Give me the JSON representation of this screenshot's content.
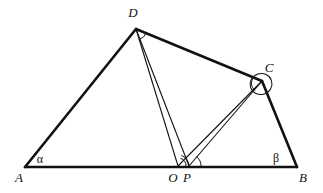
{
  "figure": {
    "canvas": {
      "width": 323,
      "height": 193
    },
    "stroke_color": "#111111",
    "background_color": "#ffffff",
    "outline_stroke_width": 2.6,
    "cevian_stroke_width": 1.1,
    "arc_stroke_width": 1.0,
    "points": {
      "A": {
        "label": "A",
        "x": 25,
        "y": 167,
        "label_x": 19,
        "label_y": 182
      },
      "B": {
        "label": "B",
        "x": 297,
        "y": 167,
        "label_x": 303,
        "label_y": 182
      },
      "C": {
        "label": "C",
        "x": 262,
        "y": 81,
        "label_x": 269,
        "label_y": 72
      },
      "D": {
        "label": "D",
        "x": 136,
        "y": 29,
        "label_x": 133,
        "label_y": 17
      },
      "O": {
        "label": "O",
        "x": 178,
        "y": 166,
        "label_x": 173,
        "label_y": 182
      },
      "P": {
        "label": "P",
        "x": 189,
        "y": 166,
        "label_x": 187,
        "label_y": 182
      }
    },
    "angles": [
      {
        "name": "alpha",
        "label": "α",
        "at": "A",
        "label_x": 40,
        "label_y": 163
      },
      {
        "name": "beta",
        "label": "β",
        "at": "B",
        "label_x": 276,
        "label_y": 162
      }
    ],
    "outline_edges": [
      {
        "name": "edge-AD",
        "from": "A",
        "to": "D"
      },
      {
        "name": "edge-DC",
        "from": "D",
        "to": "C"
      },
      {
        "name": "edge-CB",
        "from": "C",
        "to": "B"
      },
      {
        "name": "edge-AB",
        "from": "A",
        "to": "B"
      }
    ],
    "cevians": [
      {
        "name": "segment-DO",
        "from": "D",
        "to": "O"
      },
      {
        "name": "segment-DP",
        "from": "D",
        "to": "P"
      },
      {
        "name": "segment-CO",
        "from": "C",
        "to": "O"
      },
      {
        "name": "segment-CP",
        "from": "C",
        "to": "P"
      }
    ],
    "angle_marks": [
      {
        "name": "angle-arc-at-D",
        "vertex": "D",
        "radius": 11
      },
      {
        "name": "angle-arc-at-C-outer",
        "vertex": "C",
        "radius": 11
      },
      {
        "name": "angle-arc-at-C-inner",
        "vertex": "C",
        "radius": 8
      },
      {
        "name": "angle-arc-at-O-outer",
        "vertex": "O",
        "radius": 11
      },
      {
        "name": "angle-arc-at-O-inner",
        "vertex": "O",
        "radius": 8
      },
      {
        "name": "angle-arc-at-P",
        "vertex": "P",
        "radius": 12
      }
    ]
  }
}
